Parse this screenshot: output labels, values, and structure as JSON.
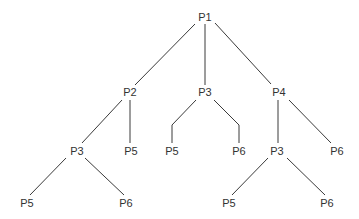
{
  "diagram": {
    "type": "tree",
    "line_color": "#3a3a3a",
    "text_color": "#333333",
    "nodes": [
      {
        "id": "n1",
        "label": "P1",
        "x": 205,
        "y": 17
      },
      {
        "id": "n2",
        "label": "P2",
        "x": 130,
        "y": 92
      },
      {
        "id": "n3",
        "label": "P3",
        "x": 205,
        "y": 92
      },
      {
        "id": "n4",
        "label": "P4",
        "x": 279,
        "y": 92
      },
      {
        "id": "n5",
        "label": "P3",
        "x": 77,
        "y": 151
      },
      {
        "id": "n6",
        "label": "P5",
        "x": 131,
        "y": 151
      },
      {
        "id": "n7",
        "label": "P5",
        "x": 172,
        "y": 151
      },
      {
        "id": "n8",
        "label": "P6",
        "x": 239,
        "y": 151
      },
      {
        "id": "n9",
        "label": "P3",
        "x": 277,
        "y": 151
      },
      {
        "id": "n10",
        "label": "P6",
        "x": 337,
        "y": 151
      },
      {
        "id": "n11",
        "label": "P5",
        "x": 27,
        "y": 203
      },
      {
        "id": "n12",
        "label": "P6",
        "x": 126,
        "y": 203
      },
      {
        "id": "n13",
        "label": "P5",
        "x": 229,
        "y": 203
      },
      {
        "id": "n14",
        "label": "P6",
        "x": 327,
        "y": 203
      }
    ],
    "edges": [
      {
        "from": "n1",
        "to": "n2",
        "points": "195,24 135,85"
      },
      {
        "from": "n1",
        "to": "n3",
        "points": "205,24 205,85"
      },
      {
        "from": "n1",
        "to": "n4",
        "points": "215,23 271,84"
      },
      {
        "from": "n2",
        "to": "n5",
        "points": "122,100 82,143"
      },
      {
        "from": "n2",
        "to": "n6",
        "points": "130,100 130,143"
      },
      {
        "from": "n3",
        "to": "n7",
        "points": "196,100 172,125 172,143"
      },
      {
        "from": "n3",
        "to": "n8",
        "points": "214,100 239,125 239,143"
      },
      {
        "from": "n4",
        "to": "n9",
        "points": "278,100 278,143"
      },
      {
        "from": "n4",
        "to": "n10",
        "points": "289,100 331,143"
      },
      {
        "from": "n5",
        "to": "n11",
        "points": "66,158 30,195"
      },
      {
        "from": "n5",
        "to": "n12",
        "points": "85,158 124,195"
      },
      {
        "from": "n9",
        "to": "n13",
        "points": "268,158 232,195"
      },
      {
        "from": "n9",
        "to": "n14",
        "points": "287,158 325,195"
      }
    ]
  }
}
